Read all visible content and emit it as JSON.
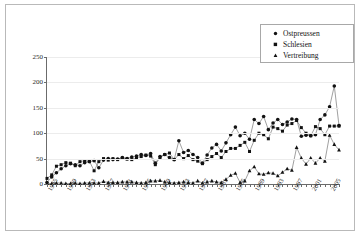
{
  "chart_data": {
    "type": "line",
    "title": "",
    "subtitle": "",
    "xlabel": "",
    "ylabel": "",
    "ylim": [
      0,
      250
    ],
    "yticks": [
      0,
      50,
      100,
      150,
      200,
      250
    ],
    "xlim": [
      1945,
      2007
    ],
    "xticks": [
      1945,
      1949,
      1953,
      1957,
      1961,
      1965,
      1969,
      1973,
      1977,
      1981,
      1985,
      1989,
      1993,
      1997,
      2001,
      2005
    ],
    "xtick_labels": [
      "1945",
      "1949",
      "1953",
      "1957",
      "1961",
      "1965",
      "1969",
      "1973",
      "1977",
      "1981",
      "1985",
      "1989",
      "1993",
      "1997",
      "2001",
      "2005"
    ],
    "grid": true,
    "grid_axis": "y",
    "legend_position": "top-right",
    "legend": [
      "Ostpreussen",
      "Schlesien",
      "Vertreibung"
    ],
    "markers": [
      "circle",
      "square",
      "triangle"
    ],
    "x": [
      1945,
      1946,
      1947,
      1948,
      1949,
      1950,
      1951,
      1952,
      1953,
      1954,
      1955,
      1956,
      1957,
      1958,
      1959,
      1960,
      1961,
      1962,
      1963,
      1964,
      1965,
      1966,
      1967,
      1968,
      1969,
      1970,
      1971,
      1972,
      1973,
      1974,
      1975,
      1976,
      1977,
      1978,
      1979,
      1980,
      1981,
      1982,
      1983,
      1984,
      1985,
      1986,
      1987,
      1988,
      1989,
      1990,
      1991,
      1992,
      1993,
      1994,
      1995,
      1996,
      1997,
      1998,
      1999,
      2000,
      2001,
      2002,
      2003,
      2004,
      2005,
      2006,
      2007
    ],
    "series": [
      {
        "name": "Ostpreussen",
        "marker": "circle",
        "values": [
          3,
          14,
          22,
          30,
          36,
          40,
          38,
          36,
          42,
          44,
          46,
          32,
          47,
          50,
          48,
          49,
          52,
          50,
          53,
          55,
          58,
          56,
          60,
          41,
          54,
          58,
          52,
          48,
          85,
          62,
          66,
          58,
          52,
          41,
          57,
          71,
          78,
          65,
          81,
          97,
          112,
          95,
          100,
          88,
          127,
          119,
          133,
          107,
          120,
          127,
          117,
          122,
          128,
          127,
          94,
          96,
          95,
          97,
          127,
          136,
          152,
          193,
          115
        ]
      },
      {
        "name": "Schlesien",
        "marker": "square",
        "values": [
          11,
          18,
          35,
          38,
          42,
          41,
          36,
          44,
          46,
          45,
          26,
          44,
          50,
          47,
          50,
          48,
          51,
          49,
          48,
          52,
          54,
          57,
          55,
          38,
          52,
          58,
          61,
          48,
          58,
          50,
          56,
          48,
          45,
          40,
          48,
          54,
          60,
          52,
          64,
          70,
          70,
          76,
          82,
          64,
          86,
          100,
          97,
          89,
          112,
          109,
          104,
          116,
          119,
          125,
          111,
          100,
          95,
          113,
          109,
          97,
          114,
          114,
          114
        ]
      },
      {
        "name": "Vertreibung",
        "marker": "triangle",
        "values": [
          1,
          1,
          2,
          2,
          1,
          1,
          2,
          1,
          2,
          2,
          2,
          2,
          5,
          3,
          3,
          3,
          4,
          4,
          4,
          3,
          2,
          3,
          6,
          6,
          7,
          4,
          3,
          2,
          3,
          4,
          3,
          2,
          6,
          2,
          4,
          6,
          4,
          3,
          9,
          17,
          21,
          3,
          6,
          26,
          34,
          20,
          19,
          22,
          21,
          16,
          23,
          30,
          27,
          72,
          51,
          39,
          51,
          41,
          51,
          45,
          96,
          78,
          67
        ]
      }
    ]
  },
  "legend": {
    "items": [
      {
        "label": "Ostpreussen",
        "marker": "circle"
      },
      {
        "label": "Schlesien",
        "marker": "square"
      },
      {
        "label": "Vertreibung",
        "marker": "triangle"
      }
    ]
  }
}
